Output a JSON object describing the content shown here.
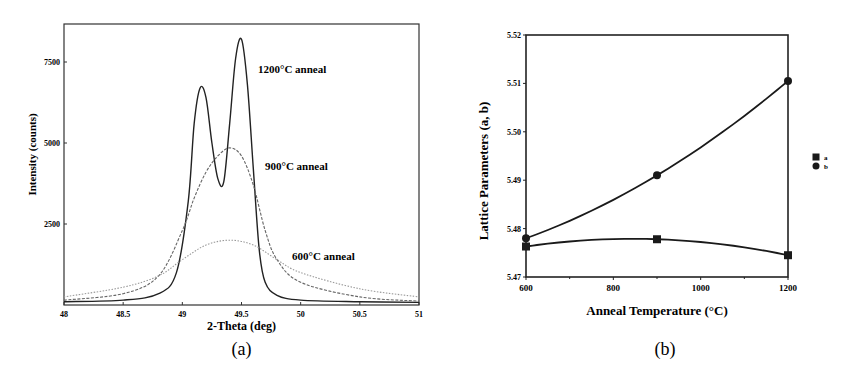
{
  "chart_data": [
    {
      "id": "a",
      "type": "line",
      "caption": "(a)",
      "xlabel": "2-Theta (deg)",
      "ylabel": "Intensity (counts)",
      "xlim": [
        48,
        51
      ],
      "ylim": [
        0,
        8600
      ],
      "xticks": [
        "48",
        "48.5",
        "49",
        "49.5",
        "50",
        "50.5",
        "51"
      ],
      "yticks": [
        "2500",
        "5000",
        "7500"
      ],
      "grid": false,
      "series": [
        {
          "name": "1200°C anneal",
          "style": "solid",
          "x": [
            48.0,
            48.5,
            48.8,
            48.95,
            49.05,
            49.1,
            49.15,
            49.2,
            49.25,
            49.3,
            49.35,
            49.4,
            49.45,
            49.5,
            49.55,
            49.6,
            49.65,
            49.7,
            49.8,
            50.0,
            50.5,
            51.0
          ],
          "y": [
            100,
            150,
            350,
            1000,
            3200,
            5600,
            6700,
            6400,
            5000,
            3900,
            3800,
            5600,
            7600,
            8200,
            6800,
            4200,
            1700,
            700,
            300,
            150,
            100,
            80
          ]
        },
        {
          "name": "900°C anneal",
          "style": "dashed",
          "x": [
            48.0,
            48.5,
            48.8,
            49.0,
            49.1,
            49.2,
            49.3,
            49.4,
            49.5,
            49.6,
            49.7,
            49.8,
            50.0,
            50.5,
            51.0
          ],
          "y": [
            150,
            350,
            900,
            2300,
            3300,
            4100,
            4600,
            4850,
            4600,
            3700,
            2300,
            1400,
            700,
            250,
            120
          ]
        },
        {
          "name": "600°C anneal",
          "style": "dotted",
          "x": [
            48.0,
            48.5,
            48.8,
            49.0,
            49.2,
            49.4,
            49.6,
            49.8,
            50.0,
            50.5,
            51.0
          ],
          "y": [
            250,
            550,
            900,
            1400,
            1850,
            2000,
            1850,
            1400,
            1000,
            500,
            250
          ]
        }
      ],
      "annotations": [
        "1200°C anneal",
        "900°C anneal",
        "600°C anneal"
      ]
    },
    {
      "id": "b",
      "type": "line",
      "caption": "(b)",
      "xlabel": "Anneal Temperature (°C)",
      "ylabel": "Lattice Parameters (a, b)",
      "xlim": [
        600,
        1200
      ],
      "ylim": [
        5.47,
        5.52
      ],
      "xticks": [
        "600",
        "800",
        "1000",
        "1200"
      ],
      "yticks": [
        "5.47",
        "5.48",
        "5.49",
        "5.50",
        "5.51",
        "5.52"
      ],
      "grid": false,
      "legend_position": "right",
      "series": [
        {
          "name": "a",
          "marker": "square",
          "x": [
            600,
            900,
            1200
          ],
          "y": [
            5.4763,
            5.4778,
            5.4745
          ]
        },
        {
          "name": "b",
          "marker": "circle",
          "x": [
            600,
            900,
            1200
          ],
          "y": [
            5.478,
            5.491,
            5.5105
          ]
        }
      ]
    }
  ]
}
